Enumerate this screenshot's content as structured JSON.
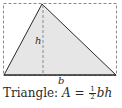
{
  "diagram": {
    "shape": "triangle",
    "labels": {
      "height": "h",
      "base": "b"
    },
    "caption": {
      "name": "Triangle:",
      "formula_lhs": "A",
      "equals": "=",
      "fraction_num": "1",
      "fraction_den": "2",
      "formula_rhs": "bh"
    },
    "colors": {
      "fill": "#e6e6e6",
      "stroke": "#2a2a2a",
      "dashed": "#8a8a8a"
    }
  }
}
